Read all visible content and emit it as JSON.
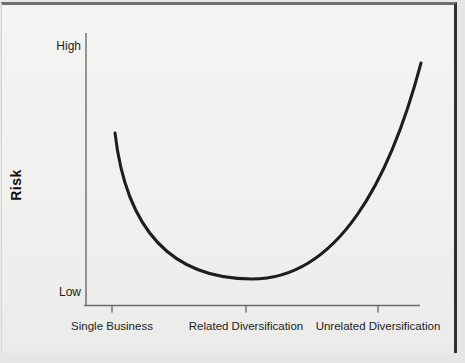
{
  "figure": {
    "y_axis_label": "Risk",
    "y_high_label": "High",
    "y_low_label": "Low",
    "x_labels": [
      "Single Business",
      "Related Diversification",
      "Unrelated Diversification"
    ]
  },
  "chart_data": {
    "type": "line",
    "title": "",
    "xlabel": "",
    "ylabel": "Risk",
    "x_categories": [
      "Single Business",
      "Related Diversification",
      "Unrelated Diversification"
    ],
    "y_axis_endpoint_labels": [
      "Low",
      "High"
    ],
    "grid": false,
    "legend": false,
    "shape_note": "U-shaped curve: risk is moderately high for a single business, lowest for related diversification, and highest for unrelated diversification",
    "series": [
      {
        "name": "Risk",
        "points_normalized": [
          {
            "x": 0.09,
            "y": 0.63
          },
          {
            "x": 0.28,
            "y": 0.24
          },
          {
            "x": 0.5,
            "y": 0.1
          },
          {
            "x": 0.75,
            "y": 0.4
          },
          {
            "x": 1.0,
            "y": 0.89
          }
        ]
      }
    ],
    "render": {
      "canvas": {
        "width": 465,
        "height": 363
      },
      "y_axis": {
        "x": 86,
        "y1": 33,
        "y2": 306
      },
      "x_axis": {
        "x1": 84,
        "x2": 420,
        "y": 305.5
      },
      "ticks_x": [
        112,
        246,
        378
      ],
      "tick_len": 7,
      "axis_color": "#6b6b6b",
      "axis_width": 1.4,
      "curve_path": "M 115 133 C 126 228, 170 279, 252 279 C 338 279, 390 180, 421 63",
      "curve_color": "#1d1d1d",
      "curve_width": 3
    }
  }
}
